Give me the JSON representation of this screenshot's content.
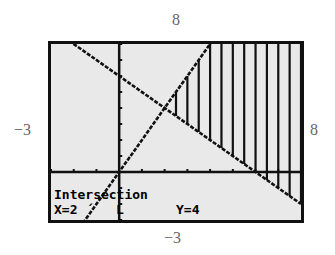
{
  "window_labels": {
    "ymax": "8",
    "xmin": "−3",
    "xmax": "8",
    "ymin": "−3"
  },
  "screen": {
    "background": "#e9e9e9",
    "ink": "#111111",
    "status_title": "Intersection",
    "status_x": "X=2",
    "status_y": "Y=4"
  },
  "chart_data": {
    "type": "line",
    "title": "",
    "subtitle": "Graphing calculator: intersection of two lines with shaded region",
    "xlabel": "",
    "ylabel": "",
    "xlim": [
      -3,
      8
    ],
    "ylim": [
      -3,
      8
    ],
    "grid": false,
    "axes": true,
    "tick_spacing": 1,
    "series": [
      {
        "name": "y = 2x",
        "slope": 2,
        "intercept": 0,
        "x": [
          -3,
          8
        ],
        "y": [
          -6,
          16
        ]
      },
      {
        "name": "y = 6 - x",
        "slope": -1,
        "intercept": 6,
        "x": [
          -3,
          8
        ],
        "y": [
          9,
          -2
        ]
      }
    ],
    "shaded_region": {
      "style": "vertical-lines",
      "x_from": 2,
      "x_to": 8,
      "lower": "y = 6 - x",
      "upper": "y = 2x",
      "step": 0.5
    },
    "annotations": [
      {
        "text": "Intersection",
        "x": 2,
        "y": 4
      }
    ]
  }
}
